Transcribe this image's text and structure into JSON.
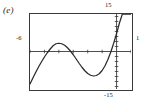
{
  "figure": {
    "panel_label": "(e)",
    "style": "graphing-calculator-window"
  },
  "labels": {
    "y_max": "15",
    "y_min": "-15",
    "x_min": "-6",
    "x_max": "1"
  },
  "chart_data": {
    "type": "line",
    "title": "(e)",
    "xlabel": "",
    "ylabel": "",
    "xlim": [
      -6,
      1
    ],
    "ylim": [
      -15,
      15
    ],
    "grid": false,
    "legend": null,
    "axes": {
      "x_axis_y_value": 0,
      "y_axis_x_value": 0,
      "x_tick_interval": 1,
      "y_tick_interval": 2,
      "ticks_on_axes": true,
      "border_box": true
    },
    "annotations": [
      {
        "text": "15",
        "position": "top-right-outside",
        "refers_to": "y-axis maximum"
      },
      {
        "text": "-15",
        "position": "bottom-right-outside",
        "refers_to": "y-axis minimum"
      },
      {
        "text": "-6",
        "position": "left-outside",
        "refers_to": "x-axis minimum"
      },
      {
        "text": "1",
        "position": "right-outside",
        "refers_to": "x-axis maximum"
      }
    ],
    "series": [
      {
        "name": "curve",
        "description": "cubic-like curve rising from lower left, local maximum near x=-4.2, local minimum near x=-1.1, then steeply increasing",
        "x": [
          -6.0,
          -5.8,
          -5.6,
          -5.4,
          -5.2,
          -5.0,
          -4.8,
          -4.6,
          -4.4,
          -4.2,
          -4.0,
          -3.8,
          -3.6,
          -3.4,
          -3.2,
          -3.0,
          -2.8,
          -2.6,
          -2.4,
          -2.2,
          -2.0,
          -1.8,
          -1.6,
          -1.4,
          -1.2,
          -1.0,
          -0.8,
          -0.6,
          -0.4,
          -0.2,
          0.0,
          0.2,
          0.4,
          0.6,
          0.8,
          1.0
        ],
        "y": [
          -13.0,
          -10.6,
          -8.3,
          -6.1,
          -4.1,
          -2.2,
          -0.5,
          1.0,
          2.3,
          3.1,
          3.3,
          3.1,
          2.5,
          1.5,
          0.2,
          -1.3,
          -3.0,
          -4.7,
          -6.3,
          -7.7,
          -8.8,
          -9.5,
          -9.8,
          -9.6,
          -8.9,
          -7.6,
          -5.7,
          -3.2,
          -0.2,
          3.3,
          7.2,
          11.4,
          15.0,
          15.0,
          15.0,
          15.0
        ]
      }
    ]
  }
}
